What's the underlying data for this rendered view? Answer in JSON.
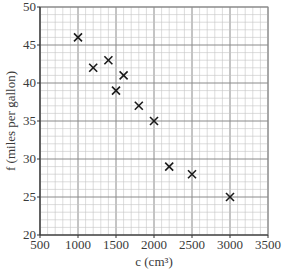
{
  "chart_data": {
    "type": "scatter",
    "title": "",
    "xlabel": "c (cm³)",
    "ylabel": "f (miles per gallon)",
    "xlim": [
      500,
      3500
    ],
    "ylim": [
      20,
      50
    ],
    "x_ticks": [
      500,
      1000,
      1500,
      2000,
      2500,
      3000,
      3500
    ],
    "y_ticks": [
      20,
      25,
      30,
      35,
      40,
      45,
      50
    ],
    "grid": true,
    "grid_minor_x_step": 100,
    "grid_minor_y_step": 1,
    "marker": "x",
    "legend": null,
    "series": [
      {
        "name": "cars",
        "points": [
          {
            "x": 1000,
            "y": 46
          },
          {
            "x": 1200,
            "y": 42
          },
          {
            "x": 1400,
            "y": 43
          },
          {
            "x": 1500,
            "y": 39
          },
          {
            "x": 1600,
            "y": 41
          },
          {
            "x": 1800,
            "y": 37
          },
          {
            "x": 2000,
            "y": 35
          },
          {
            "x": 2200,
            "y": 29
          },
          {
            "x": 2500,
            "y": 28
          },
          {
            "x": 3000,
            "y": 25
          }
        ]
      }
    ]
  },
  "colors": {
    "grid_minor": "#c4c4c4",
    "grid_major": "#8a8a8a",
    "marker": "#1a1a1a",
    "text": "#3a3a3a"
  }
}
